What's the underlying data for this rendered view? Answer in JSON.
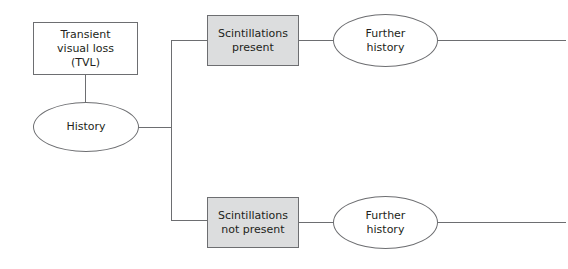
{
  "diagram": {
    "type": "flowchart",
    "colors": {
      "line": "#6d6e71",
      "shaded_box": "#dcddde",
      "box": "#ffffff",
      "text": "#231f20"
    },
    "nodes": {
      "tvl": {
        "label": "Transient\nvisual loss\n(TVL)",
        "shape": "rectangle"
      },
      "history": {
        "label": "History",
        "shape": "ellipse"
      },
      "scint_present": {
        "label": "Scintillations\npresent",
        "shape": "rectangle-shaded"
      },
      "scint_not_present": {
        "label": "Scintillations\nnot present",
        "shape": "rectangle-shaded"
      },
      "further_history_1": {
        "label": "Further\nhistory",
        "shape": "ellipse"
      },
      "further_history_2": {
        "label": "Further\nhistory",
        "shape": "ellipse"
      }
    },
    "edges": [
      {
        "from": "tvl",
        "to": "history"
      },
      {
        "from": "history",
        "to": "scint_present"
      },
      {
        "from": "history",
        "to": "scint_not_present"
      },
      {
        "from": "scint_present",
        "to": "further_history_1"
      },
      {
        "from": "scint_not_present",
        "to": "further_history_2"
      },
      {
        "from": "further_history_1",
        "to": "continues-offscreen"
      },
      {
        "from": "further_history_2",
        "to": "continues-offscreen"
      }
    ]
  }
}
